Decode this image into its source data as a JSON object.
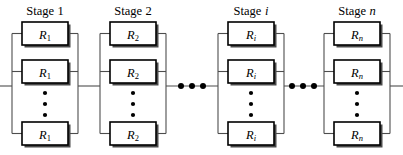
{
  "diagram": {
    "type": "reliability-block-diagram",
    "canvas": {
      "width": 403,
      "height": 155
    },
    "colors": {
      "background": "#ffffff",
      "block_stroke": "#000000",
      "block_fill": "#ffffff",
      "block_shadow": "#4a4a4a",
      "wire": "#4d4d4d",
      "text": "#000000"
    },
    "stages": [
      {
        "label_prefix": "Stage",
        "label_index": "1",
        "index_italic": false,
        "block_base": "R",
        "block_sub": "1",
        "sub_italic": false,
        "x": 22,
        "width": 46,
        "blocks": [
          "R1",
          "R1",
          "R1"
        ]
      },
      {
        "label_prefix": "Stage",
        "label_index": "2",
        "index_italic": false,
        "block_base": "R",
        "block_sub": "2",
        "sub_italic": false,
        "x": 110,
        "width": 46,
        "blocks": [
          "R2",
          "R2",
          "R2"
        ]
      },
      {
        "label_prefix": "Stage",
        "label_index": "i",
        "index_italic": true,
        "block_base": "R",
        "block_sub": "i",
        "sub_italic": true,
        "x": 228,
        "width": 46,
        "blocks": [
          "Ri",
          "Ri",
          "Ri"
        ]
      },
      {
        "label_prefix": "Stage",
        "label_index": "n",
        "index_italic": true,
        "block_base": "R",
        "block_sub": "n",
        "sub_italic": true,
        "x": 334,
        "width": 46,
        "blocks": [
          "Rn",
          "Rn",
          "Rn"
        ]
      }
    ],
    "vertical_ellipsis": {
      "symbol": "⋮",
      "dot_count": 3,
      "meaning": "additional parallel redundant blocks within stage"
    },
    "horizontal_ellipsis": {
      "symbol": "⋯",
      "dot_count": 3,
      "count": 2,
      "meaning": "additional stages in series"
    },
    "rows": {
      "top_y": 22,
      "middle_y": 60,
      "bottom_y": 122,
      "block_height": 23
    },
    "main_line_y": 86
  },
  "labels": {
    "stage_1": "Stage 1",
    "stage_2": "Stage 2",
    "stage_i": "Stage i",
    "stage_n": "Stage n",
    "r_1": "R1",
    "r_2": "R2",
    "r_i": "Ri",
    "r_n": "Rn"
  }
}
